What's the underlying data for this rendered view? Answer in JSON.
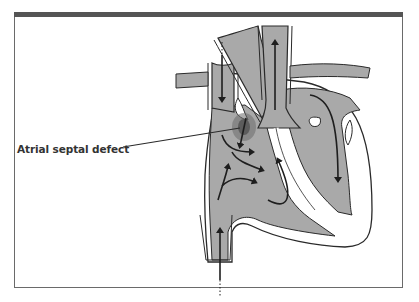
{
  "figure": {
    "annotation": {
      "label": "Atrial septal defect"
    },
    "colors": {
      "frame_top": "#555555",
      "frame_border": "#6a6a6a",
      "blood_fill": "#a9a9a9",
      "outline": "#2a2a2a",
      "background": "#ffffff"
    },
    "arrows": [
      {
        "name": "superior-vena-cava-inflow",
        "direction": "down"
      },
      {
        "name": "aorta-outflow",
        "direction": "up"
      },
      {
        "name": "inferior-vena-cava-inflow",
        "direction": "up"
      },
      {
        "name": "left-atrium-to-left-ventricle",
        "direction": "down"
      },
      {
        "name": "left-to-right-shunt",
        "direction": "down"
      },
      {
        "name": "right-atrium-to-right-ventricle",
        "direction": "down-right"
      },
      {
        "name": "right-ventricle-to-pulmonary-artery",
        "direction": "up"
      }
    ]
  }
}
